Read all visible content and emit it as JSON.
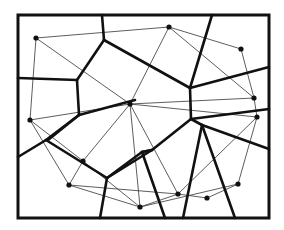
{
  "diagram": {
    "type": "voronoi-delaunay",
    "colors": {
      "line": "#111111",
      "thin_line": "#333333",
      "background": "#ffffff"
    },
    "frame": {
      "x": 18,
      "y": 15,
      "width": 251,
      "height": 203
    },
    "sites": [
      {
        "id": "p1",
        "x": 36,
        "y": 38
      },
      {
        "id": "p2",
        "x": 169,
        "y": 27
      },
      {
        "id": "p3",
        "x": 241,
        "y": 49
      },
      {
        "id": "p4",
        "x": 130,
        "y": 104
      },
      {
        "id": "p5",
        "x": 254,
        "y": 98
      },
      {
        "id": "p6",
        "x": 257,
        "y": 117
      },
      {
        "id": "p7",
        "x": 30,
        "y": 120
      },
      {
        "id": "p8",
        "x": 83,
        "y": 161
      },
      {
        "id": "p9",
        "x": 69,
        "y": 185
      },
      {
        "id": "p10",
        "x": 140,
        "y": 207
      },
      {
        "id": "p11",
        "x": 178,
        "y": 194
      },
      {
        "id": "p12",
        "x": 207,
        "y": 198
      },
      {
        "id": "p13",
        "x": 238,
        "y": 184
      }
    ],
    "delaunay_edges": [
      [
        "p1",
        "p2"
      ],
      [
        "p1",
        "p4"
      ],
      [
        "p1",
        "p7"
      ],
      [
        "p2",
        "p3"
      ],
      [
        "p2",
        "p4"
      ],
      [
        "p2",
        "p5"
      ],
      [
        "p3",
        "p5"
      ],
      [
        "p4",
        "p5"
      ],
      [
        "p4",
        "p6"
      ],
      [
        "p4",
        "p7"
      ],
      [
        "p4",
        "p8"
      ],
      [
        "p4",
        "p10"
      ],
      [
        "p4",
        "p11"
      ],
      [
        "p5",
        "p6"
      ],
      [
        "p6",
        "p13"
      ],
      [
        "p6",
        "p11"
      ],
      [
        "p7",
        "p8"
      ],
      [
        "p7",
        "p9"
      ],
      [
        "p8",
        "p9"
      ],
      [
        "p8",
        "p10"
      ],
      [
        "p9",
        "p10"
      ],
      [
        "p9",
        "p11"
      ],
      [
        "p10",
        "p11"
      ],
      [
        "p10",
        "p13"
      ],
      [
        "p11",
        "p12"
      ],
      [
        "p12",
        "p13"
      ]
    ],
    "voronoi_edges": [
      [
        [
          102,
          15
        ],
        [
          104,
          40
        ]
      ],
      [
        [
          104,
          40
        ],
        [
          77,
          80
        ]
      ],
      [
        [
          18,
          78
        ],
        [
          77,
          80
        ]
      ],
      [
        [
          77,
          80
        ],
        [
          79,
          115
        ]
      ],
      [
        [
          104,
          40
        ],
        [
          190,
          88
        ]
      ],
      [
        [
          212,
          15
        ],
        [
          190,
          88
        ]
      ],
      [
        [
          190,
          88
        ],
        [
          269,
          67
        ]
      ],
      [
        [
          190,
          88
        ],
        [
          191,
          119
        ]
      ],
      [
        [
          191,
          119
        ],
        [
          269,
          109
        ]
      ],
      [
        [
          79,
          115
        ],
        [
          46,
          140
        ]
      ],
      [
        [
          46,
          140
        ],
        [
          18,
          157
        ]
      ],
      [
        [
          79,
          115
        ],
        [
          48,
          140
        ]
      ],
      [
        [
          46,
          140
        ],
        [
          107,
          178
        ]
      ],
      [
        [
          79,
          115
        ],
        [
          135,
          100
        ]
      ],
      [
        [
          191,
          119
        ],
        [
          202,
          125
        ]
      ],
      [
        [
          191,
          119
        ],
        [
          152,
          150
        ]
      ],
      [
        [
          152,
          150
        ],
        [
          107,
          178
        ]
      ],
      [
        [
          107,
          178
        ],
        [
          100,
          218
        ]
      ],
      [
        [
          152,
          150
        ],
        [
          142,
          152
        ]
      ],
      [
        [
          142,
          152
        ],
        [
          107,
          178
        ]
      ],
      [
        [
          202,
          125
        ],
        [
          269,
          149
        ]
      ],
      [
        [
          202,
          125
        ],
        [
          183,
          218
        ]
      ],
      [
        [
          202,
          125
        ],
        [
          235,
          218
        ]
      ],
      [
        [
          142,
          152
        ],
        [
          165,
          218
        ]
      ],
      [
        [
          152,
          150
        ],
        [
          142,
          152
        ]
      ]
    ]
  }
}
